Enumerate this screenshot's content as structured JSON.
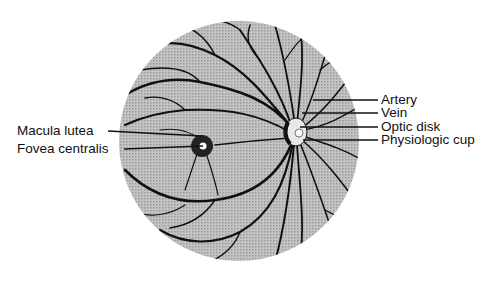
{
  "diagram": {
    "colors": {
      "background": "#ffffff",
      "fundus_fill": "#b8b8b8",
      "vessel": "#111111",
      "label_text": "#111111"
    },
    "labels_left": [
      {
        "id": "macula-lutea",
        "text": "Macula lutea"
      },
      {
        "id": "fovea-centralis",
        "text": "Fovea centralis"
      }
    ],
    "labels_right": [
      {
        "id": "artery",
        "text": "Artery"
      },
      {
        "id": "vein",
        "text": "Vein"
      },
      {
        "id": "optic-disk",
        "text": "Optic disk"
      },
      {
        "id": "physiologic-cup",
        "text": "Physiologic cup"
      }
    ]
  }
}
